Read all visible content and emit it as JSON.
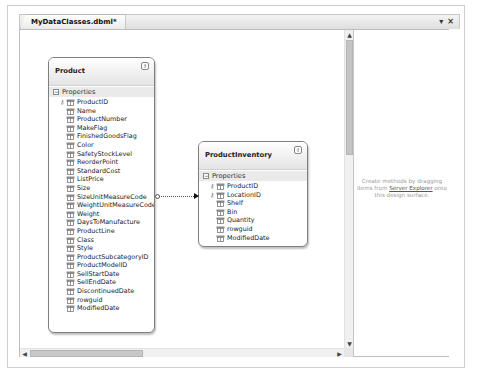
{
  "document_tab": {
    "title": "MyDataClasses.dbml*",
    "controls": {
      "dropdown": "▾",
      "close": "×"
    }
  },
  "designer": {
    "entities": [
      {
        "name": "Product",
        "section": "Properties",
        "properties": [
          {
            "name": "ProductID",
            "key": true
          },
          {
            "name": "Name",
            "key": false
          },
          {
            "name": "ProductNumber",
            "key": false
          },
          {
            "name": "MakeFlag",
            "key": false
          },
          {
            "name": "FinishedGoodsFlag",
            "key": false
          },
          {
            "name": "Color",
            "key": false
          },
          {
            "name": "SafetyStockLevel",
            "key": false
          },
          {
            "name": "ReorderPoint",
            "key": false
          },
          {
            "name": "StandardCost",
            "key": false
          },
          {
            "name": "ListPrice",
            "key": false
          },
          {
            "name": "Size",
            "key": false
          },
          {
            "name": "SizeUnitMeasureCode",
            "key": false
          },
          {
            "name": "WeightUnitMeasureCode",
            "key": false
          },
          {
            "name": "Weight",
            "key": false
          },
          {
            "name": "DaysToManufacture",
            "key": false
          },
          {
            "name": "ProductLine",
            "key": false
          },
          {
            "name": "Class",
            "key": false
          },
          {
            "name": "Style",
            "key": false
          },
          {
            "name": "ProductSubcategoryID",
            "key": false
          },
          {
            "name": "ProductModelID",
            "key": false
          },
          {
            "name": "SellStartDate",
            "key": false
          },
          {
            "name": "SellEndDate",
            "key": false
          },
          {
            "name": "DiscontinuedDate",
            "key": false
          },
          {
            "name": "rowguid",
            "key": false
          },
          {
            "name": "ModifiedDate",
            "key": false
          }
        ]
      },
      {
        "name": "ProductInventory",
        "section": "Properties",
        "properties": [
          {
            "name": "ProductID",
            "key": true
          },
          {
            "name": "LocationID",
            "key": true
          },
          {
            "name": "Shelf",
            "key": false
          },
          {
            "name": "Bin",
            "key": false
          },
          {
            "name": "Quantity",
            "key": false
          },
          {
            "name": "rowguid",
            "key": false
          },
          {
            "name": "ModifiedDate",
            "key": false
          }
        ]
      }
    ],
    "association": {
      "from": "Product",
      "to": "ProductInventory"
    }
  },
  "methods_pane": {
    "hint_before": "Create methods by dragging items from ",
    "hint_link": "Server Explorer",
    "hint_after": " onto this design surface."
  },
  "scrollbars": {
    "up": "▲",
    "down": "▼",
    "left": "◀",
    "right": "▶"
  },
  "icons": {
    "collapse": "⇑",
    "section_expander": "−",
    "key": "⚷"
  }
}
